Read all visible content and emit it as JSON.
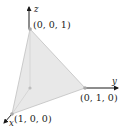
{
  "diagram": {
    "type": "3d-coordinate-tetrahedron",
    "axes": {
      "x": {
        "label": "x"
      },
      "y": {
        "label": "y"
      },
      "z": {
        "label": "z"
      }
    },
    "points": [
      {
        "id": "p_z",
        "label": "(0, 0, 1)"
      },
      {
        "id": "p_y",
        "label": "(0, 1, 0)"
      },
      {
        "id": "p_x",
        "label": "(1, 0, 0)"
      }
    ],
    "colors": {
      "face": "#e6e6e6",
      "edge": "#b8b8b8",
      "axis": "#1a1a1a",
      "point": "#a8a8a8"
    }
  }
}
